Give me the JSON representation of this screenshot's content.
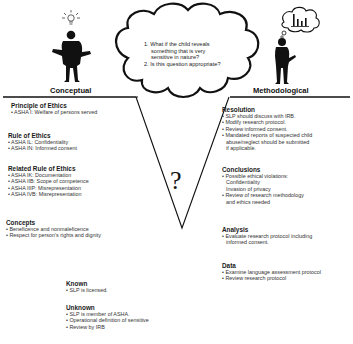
{
  "figures": {
    "left_label": "Conceptual",
    "right_label": "Methodological",
    "left_icon": "lightbulb-icon",
    "right_icon": "bar-chart-thought-icon"
  },
  "cloud": {
    "questions": [
      "1. What if the child reveals",
      "something that is very",
      "sensitive in nature?",
      "2. Is this question appropriate?"
    ]
  },
  "center_symbol": "?",
  "left_sections": [
    {
      "title": "Principle of Ethics",
      "items": [
        "• ASHA I: Welfare of persons served"
      ]
    },
    {
      "title": "Rule of Ethics",
      "items": [
        "• ASHA IL: Confidentiality",
        "• ASHA IN: Informed consent"
      ]
    },
    {
      "title": "Related Rule of Ethics",
      "items": [
        "• ASHA IK: Documentation",
        "• ASHA IIB: Scope of competence",
        "• ASHA IIIP: Misrepresentation",
        "• ASHA IVB: Misrepresentation"
      ]
    },
    {
      "title": "Concepts",
      "items": [
        "• Beneficence and nonmaleficence",
        "• Respect for person's rights and dignity"
      ]
    }
  ],
  "bottom_sections": [
    {
      "title": "Known",
      "items": [
        "• SLP is licensed."
      ]
    },
    {
      "title": "Unknown",
      "items": [
        "• SLP is member of ASHA.",
        "• Operational definition of sensitive",
        "• Review by IRB"
      ]
    }
  ],
  "right_sections": [
    {
      "title": "Resolution",
      "items": [
        "• SLP should discuss with IRB.",
        "• Modify research protocol.",
        "• Review informed consent.",
        "• Mandated reports of suspected child",
        "abuse/neglect should be submitted",
        "if applicable."
      ]
    },
    {
      "title": "Conclusions",
      "items": [
        "• Possible ethical violations:",
        "Confidentiality",
        "Invasion of privacy",
        "• Review of research methodology",
        "and ethics needed"
      ]
    },
    {
      "title": "Analysis",
      "items": [
        "• Evaluate research protocol including",
        "informed consent."
      ]
    },
    {
      "title": "Data",
      "items": [
        "• Examine language assessment protocol",
        "• Review research protocol"
      ]
    }
  ]
}
